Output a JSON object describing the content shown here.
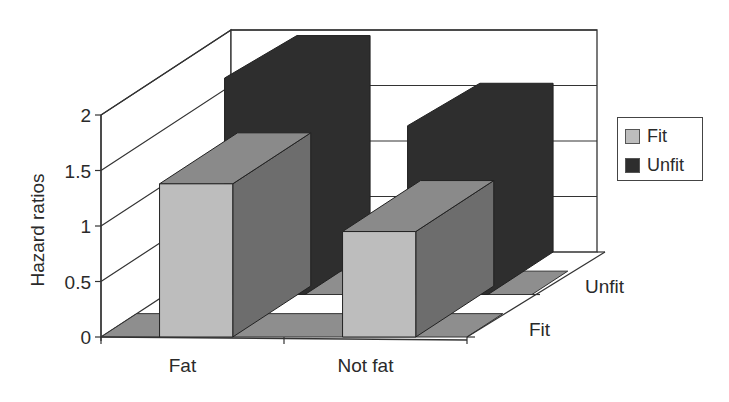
{
  "chart_data": {
    "type": "bar",
    "subtype": "3d-bar",
    "title": "",
    "xlabel": "",
    "ylabel": "Hazard ratios",
    "categories": [
      "Fat",
      "Not fat"
    ],
    "depth_categories": [
      "Fit",
      "Unfit"
    ],
    "series": [
      {
        "name": "Fit",
        "values": [
          1.38,
          0.95
        ],
        "color": "#bdbdbd"
      },
      {
        "name": "Unfit",
        "values": [
          1.95,
          1.52
        ],
        "color": "#2e2e2e"
      }
    ],
    "yticks": [
      "0",
      "0.5",
      "1",
      "1.5",
      "2"
    ],
    "ylim": [
      0,
      2
    ],
    "grid": true,
    "legend_position": "right"
  },
  "legend": {
    "items": [
      {
        "label": "Fit",
        "color": "#bdbdbd"
      },
      {
        "label": "Unfit",
        "color": "#2e2e2e"
      }
    ]
  }
}
